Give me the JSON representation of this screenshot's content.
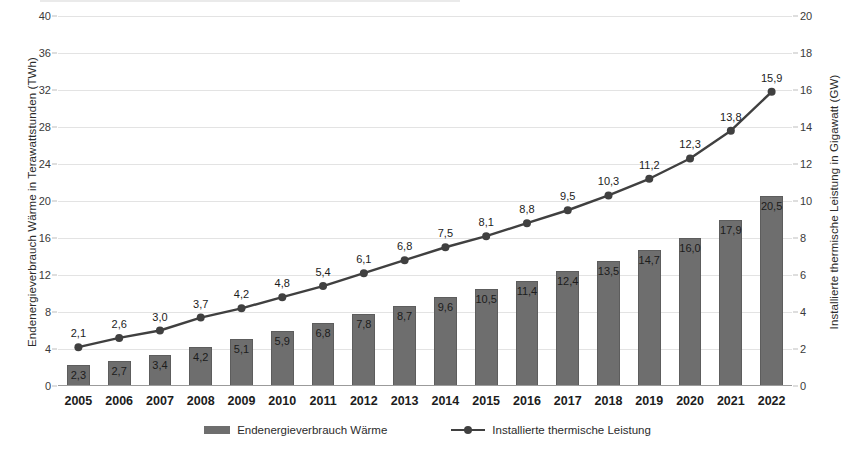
{
  "chart_data": {
    "type": "bar",
    "title": "",
    "subtitle": "",
    "xlabel": "",
    "ylabel": "Endenergieverbrauch Wärme in Terawattstunden (TWh)",
    "y2label": "Installierte thermische Leistung in Gigawatt (GW)",
    "categories": [
      "2005",
      "2006",
      "2007",
      "2008",
      "2009",
      "2010",
      "2011",
      "2012",
      "2013",
      "2014",
      "2015",
      "2016",
      "2017",
      "2018",
      "2019",
      "2020",
      "2021",
      "2022"
    ],
    "ylim": [
      0,
      40
    ],
    "y2lim": [
      0,
      20
    ],
    "yticks": [
      "0",
      "4",
      "8",
      "12",
      "16",
      "20",
      "24",
      "28",
      "32",
      "36",
      "40"
    ],
    "ytick_values": [
      0,
      4,
      8,
      12,
      16,
      20,
      24,
      28,
      32,
      36,
      40
    ],
    "y2ticks": [
      "0",
      "2",
      "4",
      "6",
      "8",
      "10",
      "12",
      "14",
      "16",
      "18",
      "20"
    ],
    "y2tick_values": [
      0,
      2,
      4,
      6,
      8,
      10,
      12,
      14,
      16,
      18,
      20
    ],
    "grid": true,
    "legend_position": "bottom",
    "decimal_separator": ",",
    "series": [
      {
        "name": "Endenergieverbrauch Wärme",
        "type": "bar",
        "axis": "left",
        "unit": "TWh",
        "color": "#6e6e6e",
        "values": [
          2.3,
          2.7,
          3.4,
          4.2,
          5.1,
          5.9,
          6.8,
          7.8,
          8.7,
          9.6,
          10.5,
          11.4,
          12.4,
          13.5,
          14.7,
          16.0,
          17.9,
          20.5
        ],
        "labels": [
          "2,3",
          "2,7",
          "3,4",
          "4,2",
          "5,1",
          "5,9",
          "6,8",
          "7,8",
          "8,7",
          "9,6",
          "10,5",
          "11,4",
          "12,4",
          "13,5",
          "14,7",
          "16,0",
          "17,9",
          "20,5"
        ]
      },
      {
        "name": "Installierte thermische Leistung",
        "type": "line",
        "axis": "right",
        "unit": "GW",
        "color": "#404040",
        "values": [
          2.1,
          2.6,
          3.0,
          3.7,
          4.2,
          4.8,
          5.4,
          6.1,
          6.8,
          7.5,
          8.1,
          8.8,
          9.5,
          10.3,
          11.2,
          12.3,
          13.8,
          15.9
        ],
        "labels": [
          "2,1",
          "2,6",
          "3,0",
          "3,7",
          "4,2",
          "4,8",
          "5,4",
          "6,1",
          "6,8",
          "7,5",
          "8,1",
          "8,8",
          "9,5",
          "10,3",
          "11,2",
          "12,3",
          "13,8",
          "15,9"
        ]
      }
    ]
  },
  "legend": {
    "items": [
      {
        "label": "Endenergieverbrauch Wärme",
        "marker": "bar-swatch",
        "color": "#6e6e6e"
      },
      {
        "label": "Installierte thermische Leistung",
        "marker": "line-marker",
        "color": "#404040"
      }
    ]
  }
}
